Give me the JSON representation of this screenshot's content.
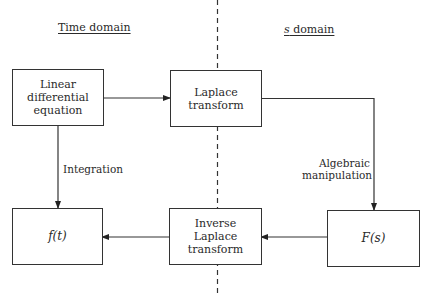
{
  "headings": {
    "left": "Time  domain",
    "right": "s domain"
  },
  "boxes": {
    "linear_ode": "Linear\ndifferential\nequation",
    "laplace": "Laplace\ntransform",
    "f_s": "F(s)",
    "inverse_laplace": "Inverse\nLaplace\ntransform",
    "f_t": "f(t)"
  },
  "edge_labels": {
    "integration": "Integration",
    "algebraic": "Algebraic\nmanipulation"
  },
  "colors": {
    "line": "#333333",
    "text": "#2a2a2a",
    "background": "#ffffff"
  }
}
